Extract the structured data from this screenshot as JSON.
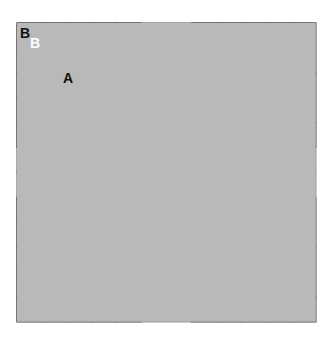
{
  "diagram": {
    "type": "quilt-block-diagram",
    "grid_size": 12,
    "origin": [
      17,
      23
    ],
    "cell": 24.9,
    "colors": {
      "background": "#ffffff",
      "light": "#b9b9b9",
      "dark": "#6b6b6b",
      "line": "#333333",
      "center": "#ffffff"
    },
    "labels": {
      "corner_outer": "B",
      "corner_inner": "B",
      "setting_triangle": "A"
    }
  }
}
